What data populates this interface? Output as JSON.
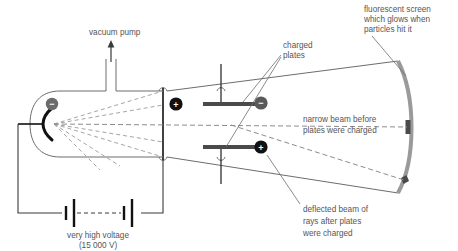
{
  "diagram": {
    "colors": {
      "outline": "#6d6d6d",
      "beam_solid": "#7a7a7a",
      "beam_dashed": "#8c8c8c",
      "text": "#555555",
      "plate": "#4a4a4a",
      "screen": "#9a9a9a",
      "spot": "#4a4a4a",
      "cathode": "#111111",
      "minus_badge": "#6b6b6b",
      "plus_badge": "#111111",
      "wire": "#3a3a3a"
    },
    "labels": {
      "vacuum_pump": "vacuum pump",
      "charged_plates_line1": "charged",
      "charged_plates_line2": "plates",
      "screen_line1": "fluorescent screen",
      "screen_line2": "which glows when",
      "screen_line3": "particles hit it",
      "narrow_beam_line1": "narrow beam before",
      "narrow_beam_line2": "plates were charged",
      "deflected_line1": "deflected beam of",
      "deflected_line2": "rays after plates",
      "deflected_line3": "were charged",
      "voltage_line1": "very high voltage",
      "voltage_line2": "(15 000 V)"
    },
    "symbols": {
      "cathode_sign": "−",
      "anode_sign": "+",
      "top_plate_sign": "−",
      "bottom_plate_sign": "+"
    }
  }
}
